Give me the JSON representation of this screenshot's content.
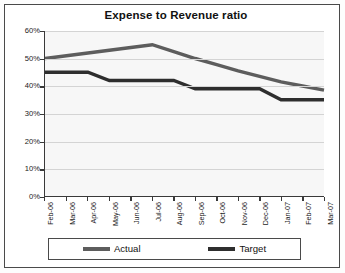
{
  "chart_data": {
    "type": "line",
    "title": "Expense to Revenue ratio",
    "xlabel": "",
    "ylabel": "",
    "ylim": [
      0,
      0.6
    ],
    "ytick_labels": [
      "60%",
      "50%",
      "40%",
      "30%",
      "20%",
      "10%",
      "0%"
    ],
    "ytick_values": [
      0.6,
      0.5,
      0.4,
      0.3,
      0.2,
      0.1,
      0.0
    ],
    "grid": true,
    "legend_position": "bottom",
    "categories": [
      "Feb-06",
      "Mar-06",
      "Apr-06",
      "May-06",
      "Jun-06",
      "Jul-06",
      "Aug-06",
      "Sep-06",
      "Oct-06",
      "Nov-06",
      "Dec-06",
      "Jan-07",
      "Feb-07",
      "Mar-07"
    ],
    "series": [
      {
        "name": "Actual",
        "color": "#5d5d5d",
        "values": [
          0.5,
          0.51,
          0.52,
          0.53,
          0.54,
          0.55,
          0.525,
          0.5,
          0.478,
          0.455,
          0.435,
          0.415,
          0.4,
          0.385
        ]
      },
      {
        "name": "Target",
        "color": "#2e2e2e",
        "values": [
          0.45,
          0.45,
          0.45,
          0.42,
          0.42,
          0.42,
          0.42,
          0.39,
          0.39,
          0.39,
          0.39,
          0.35,
          0.35,
          0.35
        ]
      }
    ]
  },
  "legend": {
    "entries": [
      {
        "label": "Actual"
      },
      {
        "label": "Target"
      }
    ]
  }
}
